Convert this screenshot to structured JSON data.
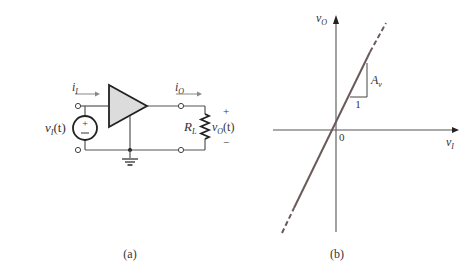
{
  "figure_a": {
    "caption": "(a)",
    "source_label": "v",
    "source_sub": "I",
    "source_arg": "(t)",
    "source_plus": "+",
    "source_minus": "−",
    "input_current": "i",
    "input_current_sub": "I",
    "output_current": "i",
    "output_current_sub": "O",
    "load_label": "R",
    "load_sub": "L",
    "output_voltage": "v",
    "output_voltage_sub": "O",
    "output_voltage_arg": "(t)",
    "output_plus": "+",
    "output_minus": "−"
  },
  "figure_b": {
    "caption": "(b)",
    "y_axis_label": "v",
    "y_axis_sub": "O",
    "x_axis_label": "v",
    "x_axis_sub": "I",
    "origin_label": "0",
    "slope_rise_label": "A",
    "slope_rise_sub": "v",
    "slope_run_label": "1"
  },
  "colors": {
    "line": "#555555",
    "transfer_line": "#6b5a5a",
    "amp_fill": "#dcdcdc",
    "text": "#333333"
  }
}
